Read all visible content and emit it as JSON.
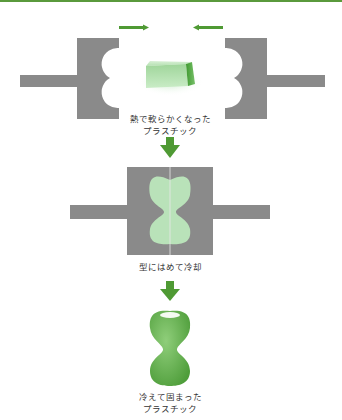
{
  "colors": {
    "mold": "#8a8a8a",
    "accent_green": "#4f9a34",
    "soft_plastic": "#b9e2b9",
    "top_bar": "#5a9a3c"
  },
  "steps": [
    {
      "id": "heated",
      "label_line1": "熱で軟らかくなった",
      "label_line2": "プラスチック"
    },
    {
      "id": "molding",
      "label_line1": "型にはめて冷却"
    },
    {
      "id": "cooled",
      "label_line1": "冷えて固まった",
      "label_line2": "プラスチック"
    }
  ],
  "icons": {
    "press_arrow_left": "arrow-right-icon",
    "press_arrow_right": "arrow-left-icon",
    "flow_arrow": "arrow-down-icon"
  }
}
